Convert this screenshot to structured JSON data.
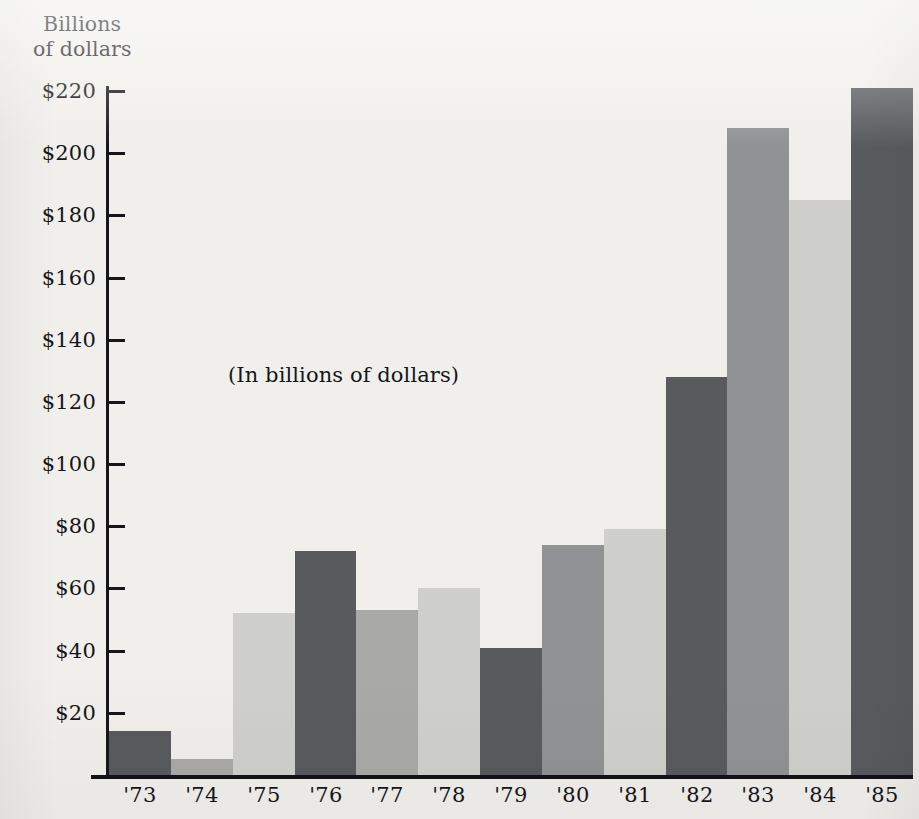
{
  "figure": {
    "axis_title_line1": "Billions",
    "axis_title_line2": "of dollars",
    "inner_note": "(In billions of dollars)",
    "background_color": "#f0efeb",
    "axis_color": "#15151a"
  },
  "chart_data": {
    "type": "bar",
    "title": "",
    "subtitle": "",
    "annotation": "(In billions of dollars)",
    "xlabel": "",
    "ylabel": "Billions of dollars",
    "categories": [
      "'73",
      "'74",
      "'75",
      "'76",
      "'77",
      "'78",
      "'79",
      "'80",
      "'81",
      "'82",
      "'83",
      "'84",
      "'85"
    ],
    "values": [
      14,
      5,
      52,
      72,
      53,
      60,
      41,
      74,
      79,
      128,
      208,
      185,
      221
    ],
    "ylim": [
      0,
      230
    ],
    "ytick_values": [
      20,
      40,
      60,
      80,
      100,
      120,
      140,
      160,
      180,
      200,
      220
    ],
    "ytick_labels": [
      "$20",
      "$40",
      "$60",
      "$80",
      "$100",
      "$120",
      "$140",
      "$160",
      "$180",
      "$200",
      "$220"
    ],
    "grid": false,
    "legend": null,
    "bar_colors": [
      "#595a5e",
      "#a9aaa8",
      "#cfd0cc",
      "#595a5e",
      "#a9aaa8",
      "#cfd0cc",
      "#595a5e",
      "#919293",
      "#cfd0cc",
      "#595a5e",
      "#919293",
      "#cfd0cc",
      "#595a5e"
    ],
    "palette": {
      "dark_gray": "#595a5e",
      "medium_gray": "#919293",
      "light_gray": "#cfd0cc"
    }
  }
}
